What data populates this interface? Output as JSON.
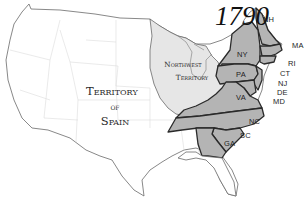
{
  "map": {
    "title": "1790",
    "colors": {
      "background": "#ffffff",
      "land_unorganized": "#ffffff",
      "northwest_territory": "#e6e6e6",
      "original_states": "#b4b4b4",
      "state_border_bold": "#2a2a2a",
      "internal_border": "#dcdcdc",
      "coastline": "#6a6a6a"
    },
    "territories": [
      {
        "id": "spain",
        "label_lines": [
          "Territory",
          "of",
          "Spain"
        ]
      },
      {
        "id": "northwest",
        "label_lines": [
          "Northwest",
          "Territory"
        ]
      }
    ],
    "states": [
      {
        "abbr": "NH"
      },
      {
        "abbr": "MA"
      },
      {
        "abbr": "NY"
      },
      {
        "abbr": "RI"
      },
      {
        "abbr": "PA"
      },
      {
        "abbr": "CT"
      },
      {
        "abbr": "NJ"
      },
      {
        "abbr": "DE"
      },
      {
        "abbr": "MD"
      },
      {
        "abbr": "VA"
      },
      {
        "abbr": "NC"
      },
      {
        "abbr": "SC"
      },
      {
        "abbr": "GA"
      }
    ]
  }
}
